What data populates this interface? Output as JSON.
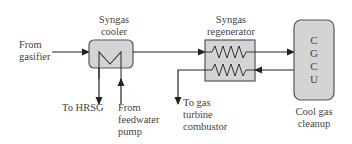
{
  "diagram": {
    "inputs": {
      "from_gasifier": [
        "From",
        "gasifier"
      ]
    },
    "components": {
      "syngas_cooler": {
        "label": [
          "Syngas",
          "cooler"
        ]
      },
      "syngas_regenerator": {
        "label": [
          "Syngas",
          "regenerator"
        ]
      },
      "cgcu": {
        "letters": [
          "C",
          "G",
          "C",
          "U"
        ],
        "caption": [
          "Cool gas",
          "cleanup"
        ]
      }
    },
    "outputs": {
      "to_hrsg": "To HRSG",
      "from_feedwater_pump": [
        "From",
        "feedwater",
        "pump"
      ],
      "to_gas_turbine_combustor": [
        "To gas",
        "turbine",
        "combustor"
      ]
    },
    "colors": {
      "box_fill": "#d4d4d4",
      "box_stroke": "#555555",
      "line": "#222222"
    }
  }
}
